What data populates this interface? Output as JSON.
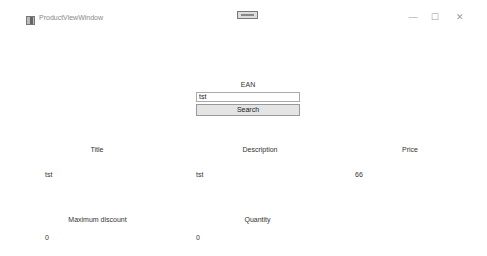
{
  "window": {
    "title": "ProductViewWindow",
    "controls": {
      "minimize": "—",
      "maximize": "☐",
      "close": "✕"
    }
  },
  "search": {
    "ean_label": "EAN",
    "ean_value": "tst",
    "search_label": "Search"
  },
  "product": {
    "title_label": "Title",
    "title_value": "tst",
    "description_label": "Description",
    "description_value": "tst",
    "price_label": "Price",
    "price_value": "66",
    "max_discount_label": "Maximum discount",
    "max_discount_value": "0",
    "quantity_label": "Quantity",
    "quantity_value": "0"
  }
}
